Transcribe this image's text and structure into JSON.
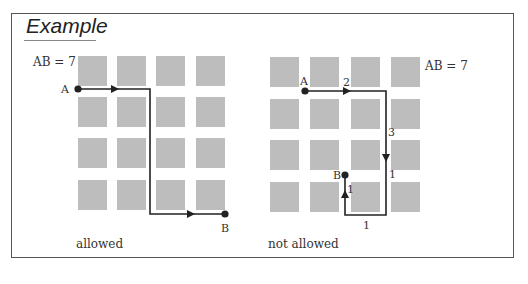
{
  "header_cut_text": "... pattern on the board that follows the new rules.",
  "panel": {
    "title": "Example"
  },
  "left_example": {
    "distance_label": "AB = 7",
    "start_label": "A",
    "end_label": "B",
    "caption": "allowed"
  },
  "right_example": {
    "distance_label": "AB = 7",
    "start_label": "A",
    "end_label": "B",
    "segment_labels": [
      "2",
      "3",
      "1",
      "1",
      "1"
    ],
    "caption": "not allowed"
  },
  "colors": {
    "square": "#bdbdbd",
    "path": "#222222",
    "frame": "#555555"
  }
}
